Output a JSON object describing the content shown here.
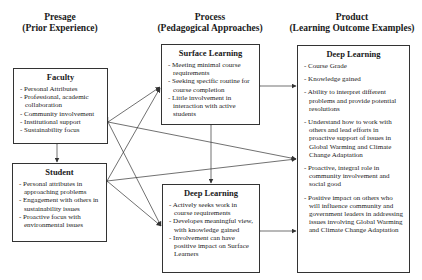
{
  "columns": {
    "presage": {
      "line1": "Presage",
      "line2": "(Prior Experience)"
    },
    "process": {
      "line1": "Process",
      "line2": "(Pedagogical Approaches)"
    },
    "product": {
      "line1": "Product",
      "line2": "(Learning Outcome Examples)"
    }
  },
  "boxes": {
    "faculty": {
      "title": "Faculty",
      "items": [
        "Personal Attributes",
        "Professional, academic collaboration",
        "Community involvement",
        "Institutional support",
        "Sustainability focus"
      ]
    },
    "student": {
      "title": "Student",
      "items": [
        "Personal attributes in approaching problems",
        "Engagement with others in sustainability issues",
        "Proactive focus with environmental issues"
      ]
    },
    "surface_learning": {
      "title": "Surface Learning",
      "items": [
        "Meeting minimal course requirements",
        "Seeking specific routine for course completion",
        "Little involvement in interaction with active students"
      ]
    },
    "process_deep_learning": {
      "title": "Deep Learning",
      "items": [
        "Actively seeks work in course requirements",
        "Developes meaningful view, with knowledge gained",
        "Involvement can have positive impact on Surface Learners"
      ]
    },
    "product_deep_learning": {
      "title": "Deep Learning",
      "items": [
        "Course Grade",
        "Knowledge gained",
        "Ability to interpret different problems and provide potential resolutions",
        "Understand how to work with others and lead efforts in proactive support of issues in Global Warming and Climate Change Adaptation",
        "Proactive, integral role in community involvement and social good",
        "Positive impact on others who will influence community and government leaders in addressing issues involving Global Warming and Climate Change Adaptation"
      ]
    }
  },
  "colors": {
    "line": "#333333",
    "text": "#1a1a1a",
    "background": "#ffffff"
  }
}
